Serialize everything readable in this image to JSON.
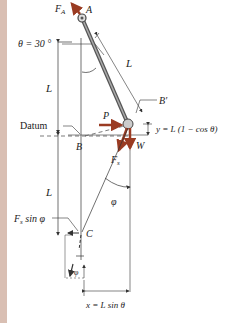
{
  "figure": {
    "labels": {
      "FA": "F",
      "FA_sub": "A",
      "A": "A",
      "L_rod": "L",
      "theta": "θ = 30 °",
      "L_upper": "L",
      "B_prime": "B′",
      "datum": "Datum",
      "P": "P",
      "y_eq": "y = L (1 − cos θ)",
      "B": "B",
      "W": "W",
      "Fs": "F",
      "Fs_sub": "s",
      "L_lower": "L",
      "phi": "φ",
      "Fs_sin": "F",
      "Fs_sin_sub": "s",
      "Fs_sin_tail": " sin φ",
      "C": "C",
      "phi_small": "φ",
      "x_eq": "x = L  sin θ"
    },
    "colors": {
      "force": "#9a3b22",
      "line": "#333333",
      "rod": "#6a6a6a",
      "edge": "#d9bfb3"
    }
  }
}
